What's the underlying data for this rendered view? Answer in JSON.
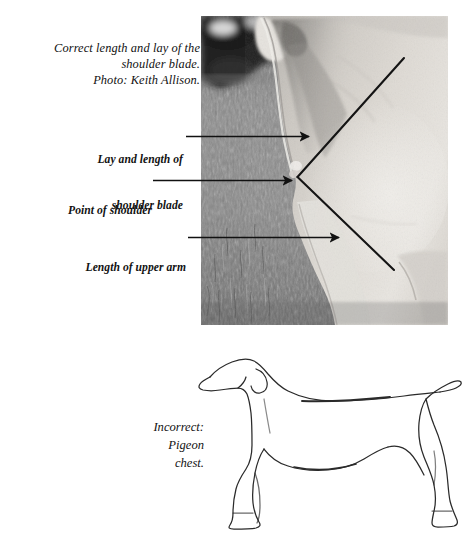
{
  "figure": {
    "photo_caption": {
      "lines": [
        "Correct length and lay of the",
        "shoulder blade.",
        "Photo: Keith Allison."
      ],
      "photographer_credit": "Photo: Keith Allison."
    },
    "callouts": [
      {
        "id": "shoulder-blade",
        "lines": [
          "Lay and length of",
          "shoulder blade"
        ],
        "text": "Lay and length of shoulder blade"
      },
      {
        "id": "point-of-shoulder",
        "lines": [
          "Point of shoulder"
        ],
        "text": "Point of shoulder"
      },
      {
        "id": "upper-arm",
        "lines": [
          "Length of upper arm"
        ],
        "text": "Length of upper arm"
      }
    ],
    "sketch_caption": {
      "lines": [
        "Incorrect:",
        "Pigeon",
        "chest."
      ],
      "text": "Incorrect: Pigeon chest."
    },
    "colors": {
      "ink": "#121212",
      "page_background": "#ffffff",
      "annotation_line": "#111111",
      "sketch_outline": "#2a2a2a"
    },
    "photo": {
      "subject": "dog-shoulder-closeup",
      "treatment": "black-and-white",
      "annotation": "V-angle marking shoulder blade and upper arm"
    },
    "sketch": {
      "subject": "dog-outline-side-view",
      "fault_illustrated": "pigeon chest"
    }
  }
}
